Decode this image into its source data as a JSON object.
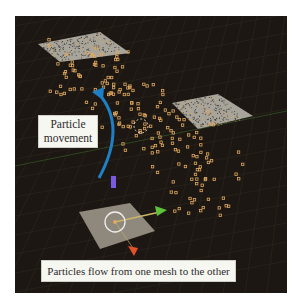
{
  "figure": {
    "labels": {
      "movement_line1": "Particle",
      "movement_line2": "movement",
      "flow": "Particles flow from one mesh to the other"
    },
    "colors": {
      "background": "#1c1712",
      "grid": "#3a3328",
      "mesh": "#a7a49c",
      "particle": "#e0a860",
      "arrow": "#1f7fc4",
      "axis_x": "#e2512a",
      "axis_y": "#5ec23a",
      "axis_z": "#7a5ae0"
    },
    "icons": [
      "curved-arrow-icon",
      "transform-gizmo-icon",
      "dashed-circle-icon"
    ]
  }
}
